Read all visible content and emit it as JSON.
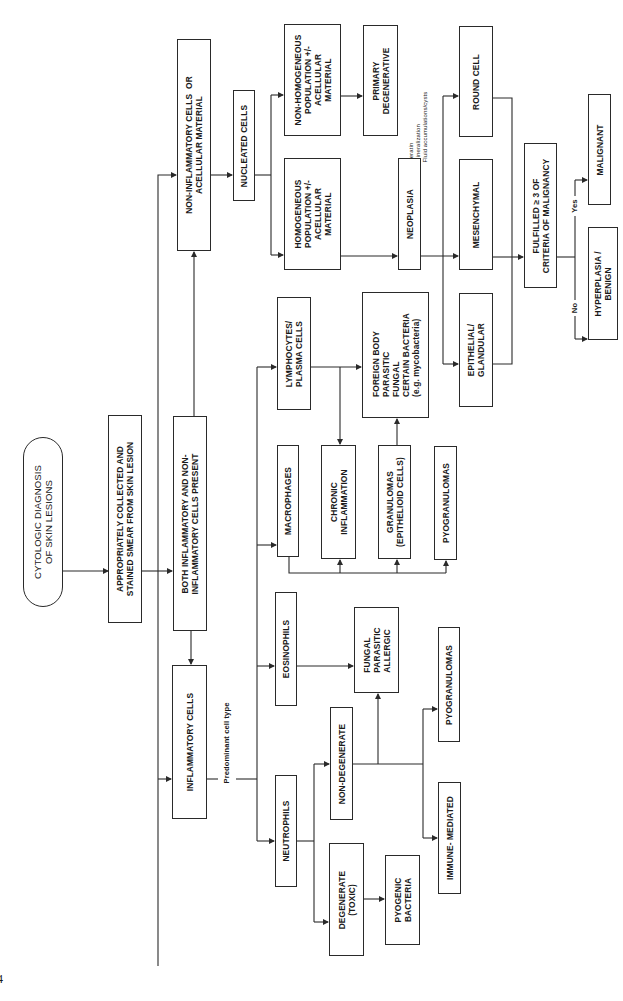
{
  "diagram": {
    "title": "CYTOLOGIC DIAGNOSIS\nOF SKIN LESIONS",
    "orientation": "rotated 90 degrees counter-clockwise",
    "page_number": "4",
    "nodes": {
      "start": "CYTOLOGIC DIAGNOSIS\nOF SKIN LESIONS",
      "smear": "APPROPRIATELY COLLECTED AND\nSTAINED SMEAR FROM SKIN LESION",
      "both": "BOTH INFLAMMATORY AND NON-\nINFLAMMATORY CELLS PRESENT",
      "noninflam": "NON-INFLAMMATORY CELLS  OR\nACELLULAR MATERIAL",
      "inflam": "INFLAMMATORY CELLS",
      "nucleated": "NUCLEATED CELLS",
      "nonhomo": "NON-HOMOGENEOUS\nPOPULATION +/-\nACELLULAR\nMATERIAL",
      "homo": "HOMOGENEOUS\nPOPULATION +/-\nACELLULAR\nMATERIAL",
      "primary": "PRIMARY\nDEGENERATIVE",
      "primary_note": "Keratin\nMineralization\nFluid accumulations/cysts",
      "neoplasia": "NEOPLASIA",
      "round": "ROUND CELL",
      "mesenchymal": "MESENCHYMAL",
      "epithelial": "EPITHELIAL/\nGLANDULAR",
      "criteria": "FULFILLED ≥ 3 OF\nCRITERIA OF MALIGNANCY",
      "malignant": "MALIGNANT",
      "hyperplasia": "HYPERPLASIA /\nBENIGN",
      "lympho": "LYMPHOCYTES/\nPLASMA CELLS",
      "foreign": "FOREIGN BODY\nPARASITIC\nFUNGAL\nCERTAIN BACTERIA\n(e.g. mycobacteria)",
      "macro": "MACROPHAGES",
      "chronic": "CHRONIC\nINFLAMMATION",
      "granulomas": "GRANULOMAS\n(EPITHELIOID CELLS)",
      "pyogran1": "PYOGRANULOMAS",
      "eosino": "EOSINOPHILS",
      "fpa": "FUNGAL\nPARASITIC\nALLERGIC",
      "neutro": "NEUTROPHILS",
      "nondeg": "NON-DEGENERATE",
      "pyogran2": "PYOGRANULOMAS",
      "immune": "IMMUNE- MEDIATED",
      "degen": "DEGENERATE\n(TOXIC)",
      "pyogenic": "PYOGENIC\nBACTERIA"
    },
    "edge_labels": {
      "predominant": "Predominant cell type",
      "yes": "Yes",
      "no": "No"
    },
    "colors": {
      "line": "#2a2a2a",
      "background": "#ffffff"
    }
  }
}
